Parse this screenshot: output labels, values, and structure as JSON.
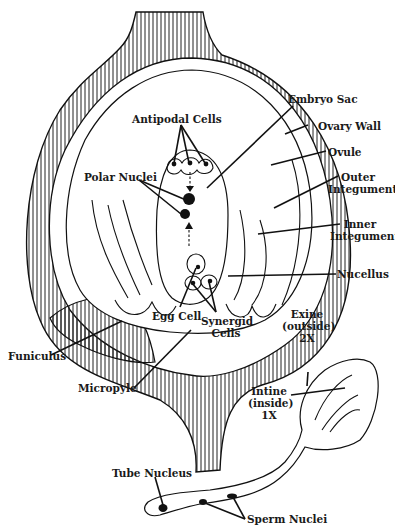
{
  "diagram": {
    "colors": {
      "ink": "#111111",
      "background": "#ffffff",
      "hatch": "#222222"
    },
    "labels": {
      "antipodal_cells": "Antipodal Cells",
      "polar_nuclei": "Polar Nuclei",
      "embryo_sac": "Embryo Sac",
      "ovary_wall": "Ovary Wall",
      "ovule": "Ovule",
      "outer_integument_1": "Outer",
      "outer_integument_2": "Integument",
      "inner_integument_1": "Inner",
      "inner_integument_2": "Integument",
      "nucellus": "Nucellus",
      "egg_cell": "Egg Cell",
      "synergid_cells_1": "Synergid",
      "synergid_cells_2": "Cells",
      "funiculus": "Funiculus",
      "micropyle": "Micropyle",
      "exine_1": "Exine",
      "exine_2": "(outside)",
      "exine_3": "2X",
      "intine_1": "Intine",
      "intine_2": "(inside)",
      "intine_3": "1X",
      "tube_nucleus": "Tube Nucleus",
      "sperm_nuclei": "Sperm Nuclei"
    }
  }
}
